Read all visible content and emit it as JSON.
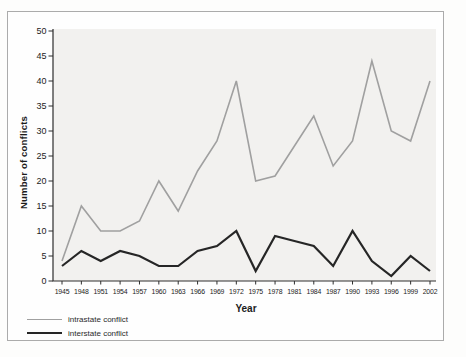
{
  "chart_data": {
    "type": "line",
    "title": "",
    "xlabel": "Year",
    "ylabel": "Number of conflicts",
    "categories": [
      "1945",
      "1948",
      "1951",
      "1954",
      "1957",
      "1960",
      "1963",
      "1966",
      "1969",
      "1972",
      "1975",
      "1978",
      "1981",
      "1984",
      "1987",
      "1990",
      "1993",
      "1996",
      "1999",
      "2002"
    ],
    "ylim": [
      0,
      50
    ],
    "ytick_step": 5,
    "yticks": [
      0,
      5,
      10,
      15,
      20,
      25,
      30,
      35,
      40,
      45,
      50
    ],
    "grid": false,
    "legend_position": "bottom-left",
    "series": [
      {
        "name": "intrastate conflict",
        "color": "#a0a0a0",
        "stroke_width": 1.6,
        "values": [
          4,
          15,
          10,
          10,
          12,
          20,
          14,
          22,
          28,
          40,
          20,
          21,
          27,
          33,
          23,
          28,
          44,
          30,
          28,
          40
        ]
      },
      {
        "name": "interstate conflict",
        "color": "#262626",
        "stroke_width": 2.2,
        "values": [
          3,
          6,
          4,
          6,
          5,
          3,
          3,
          6,
          7,
          10,
          2,
          9,
          8,
          7,
          3,
          10,
          4,
          1,
          5,
          2
        ]
      }
    ]
  },
  "colors": {
    "page_bg": "#fdfdfc",
    "frame_border": "#ababab",
    "plot_bg": "#f2f1ef",
    "axis": "#2e2e2e",
    "tick_label": "#1c1c1c"
  }
}
